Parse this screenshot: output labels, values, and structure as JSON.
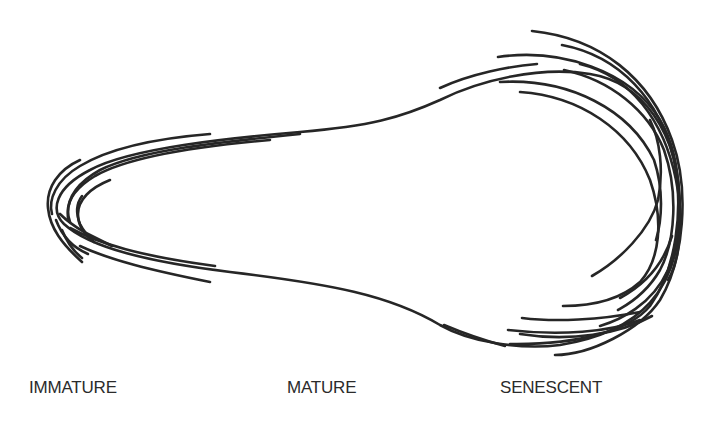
{
  "diagram": {
    "type": "life-stage outline diagram",
    "stroke_color": "#262626",
    "background_color": "#ffffff",
    "stages": [
      {
        "id": "immature",
        "label": "IMMATURE"
      },
      {
        "id": "mature",
        "label": "MATURE"
      },
      {
        "id": "senescent",
        "label": "SENESCENT"
      }
    ]
  }
}
